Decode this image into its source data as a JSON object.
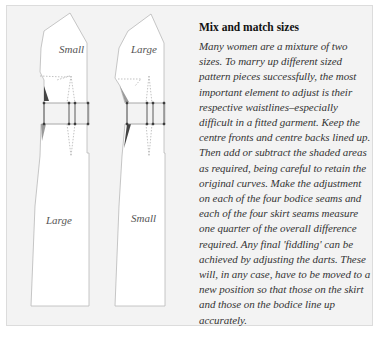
{
  "diagram": {
    "left_pattern": {
      "bodice_label": "Small",
      "skirt_label": "Large"
    },
    "right_pattern": {
      "bodice_label": "Large",
      "skirt_label": "Small"
    },
    "colors": {
      "background": "#f3f3f3",
      "piece_fill": "#ffffff",
      "outline": "#b8b8b8",
      "shade_dark": "#444444",
      "shade_light": "#9a9a9a",
      "marker": "#333333"
    }
  },
  "article": {
    "heading": "Mix and match sizes",
    "body": "Many women are a mixture of two sizes. To marry up different sized pattern pieces successfully, the most important element to adjust is their respective waistlines–especially difficult in a fitted garment. Keep the centre fronts and centre backs lined up. Then add or subtract the shaded areas as required, being careful to retain the original curves. Make the adjustment on each of the four bodice seams and each of the four skirt seams measure one quarter of the overall difference required. Any final 'fiddling' can be achieved by adjusting the darts. These will, in any case, have to be moved to a new position so that those on the skirt and those on the bodice line up accurately."
  }
}
